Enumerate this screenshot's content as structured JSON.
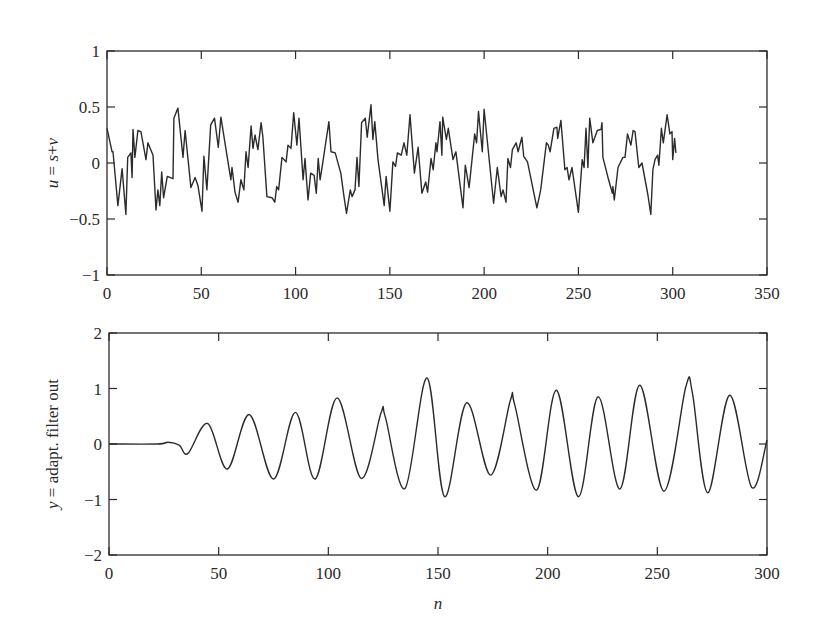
{
  "chart_data": [
    {
      "type": "line",
      "title": "",
      "xlabel": "",
      "ylabel": "u = s+v",
      "ylabel_parts": [
        "u",
        " = ",
        "s",
        "+",
        "v"
      ],
      "xlim": [
        0,
        350
      ],
      "ylim": [
        -1,
        1
      ],
      "xticks": [
        0,
        50,
        100,
        150,
        200,
        250,
        300,
        350
      ],
      "xtick_labels": [
        "0",
        "50",
        "100",
        "150",
        "200",
        "250",
        "300",
        "350"
      ],
      "yticks": [
        1,
        0.5,
        0,
        -0.5,
        -1
      ],
      "ytick_labels": [
        "1",
        "0.5",
        "0",
        "−0.5",
        "−1"
      ],
      "grid": false,
      "legend": null,
      "line_color": "#2b2b2b",
      "series": [
        {
          "name": "u = s+v",
          "x": [
            0,
            2.7,
            3.2,
            5.8,
            8,
            10,
            11,
            12.7,
            13.3,
            13.8,
            14.8,
            16.4,
            18,
            20.7,
            21.7,
            24.4,
            26,
            27,
            28,
            29,
            30,
            32,
            35,
            35.5,
            37.6,
            40.3,
            41.4,
            44.5,
            46.7,
            48.2,
            50.4,
            51.4,
            53,
            55,
            57,
            59,
            60.4,
            63.6,
            65.7,
            66.3,
            67.9,
            69.5,
            71,
            72.6,
            73.7,
            74.8,
            76.4,
            77.4,
            78.5,
            80,
            81.7,
            82.7,
            84.8,
            87.5,
            89,
            90,
            91,
            92.8,
            95,
            96,
            97.6,
            99,
            100.7,
            101.8,
            104,
            105,
            106.6,
            108,
            109.8,
            111,
            112,
            113,
            114.5,
            116,
            117.7,
            118.8,
            121,
            124,
            125.7,
            127,
            129,
            130,
            131.5,
            132.6,
            133.6,
            135,
            137,
            138,
            140,
            141,
            142,
            143.7,
            147,
            148,
            150,
            151.6,
            153,
            154,
            156,
            157.5,
            159,
            160.7,
            163,
            165,
            167,
            169,
            170,
            171.8,
            173,
            174.4,
            175,
            176.6,
            177.6,
            178,
            180,
            181,
            183.5,
            185,
            188.8,
            190,
            192,
            195,
            196,
            197,
            199,
            200,
            205,
            207,
            209,
            210,
            211.6,
            212.6,
            214,
            215,
            217,
            218,
            220,
            221,
            223,
            228,
            230,
            233,
            234,
            235,
            237,
            238.6,
            239,
            240.7,
            242.8,
            244,
            245,
            246.6,
            250,
            252,
            253,
            254,
            255,
            256,
            257.7,
            260,
            262,
            262.5,
            263,
            266,
            268,
            268.3,
            269,
            271,
            273.6,
            274.7,
            276,
            277.8,
            279,
            280,
            282,
            283.7,
            286.9,
            288.4,
            289.5,
            290.6,
            292,
            292.7,
            294,
            295,
            297,
            298.5,
            299.6,
            300,
            301,
            301.7
          ],
          "y": [
            0.31,
            0.1,
            0.1,
            -0.38,
            -0.05,
            -0.46,
            0.05,
            0.09,
            -0.13,
            0.3,
            0.05,
            0.29,
            0.28,
            0.03,
            0.18,
            0.07,
            -0.42,
            -0.24,
            -0.38,
            -0.08,
            -0.31,
            -0.12,
            -0.14,
            0.4,
            0.49,
            0.05,
            0.29,
            -0.22,
            -0.13,
            -0.2,
            -0.43,
            0.06,
            -0.24,
            0.34,
            0.4,
            0.14,
            0.41,
            0.07,
            -0.15,
            -0.04,
            -0.26,
            -0.35,
            -0.15,
            -0.24,
            0.1,
            -0.04,
            0.33,
            0.13,
            0.25,
            0.12,
            0.36,
            0.23,
            -0.3,
            -0.31,
            -0.35,
            -0.21,
            -0.24,
            0.05,
            0.01,
            0.16,
            0.13,
            0.45,
            0.16,
            0.4,
            -0.15,
            0.04,
            -0.33,
            -0.09,
            -0.11,
            -0.27,
            0.04,
            -0.15,
            0.01,
            0.18,
            0.37,
            0.1,
            0.09,
            -0.09,
            -0.3,
            -0.45,
            -0.24,
            -0.3,
            -0.24,
            0.05,
            -0.21,
            0.36,
            0.4,
            0.23,
            0.52,
            0.21,
            0.37,
            0.03,
            -0.38,
            -0.12,
            -0.43,
            0.01,
            -0.03,
            0.09,
            0.07,
            0.18,
            0.07,
            0.43,
            -0.09,
            0.14,
            -0.27,
            -0.17,
            -0.26,
            0.04,
            -0.06,
            0.18,
            0.1,
            0.37,
            0.07,
            0.41,
            0.21,
            0.31,
            0.03,
            0.1,
            -0.4,
            -0.02,
            -0.22,
            0.26,
            0.18,
            0.46,
            0.1,
            0.48,
            -0.36,
            -0.04,
            -0.3,
            -0.24,
            -0.35,
            0.04,
            -0.04,
            0.12,
            0.18,
            0.1,
            0.23,
            0.06,
            0.01,
            -0.4,
            -0.24,
            0.18,
            0.16,
            0.1,
            0.31,
            0.32,
            0.22,
            0.38,
            -0.06,
            -0.04,
            -0.15,
            -0.04,
            -0.44,
            0.03,
            -0.04,
            0.31,
            -0.04,
            0.4,
            0.18,
            0.29,
            0.3,
            0.36,
            0.05,
            -0.15,
            -0.27,
            -0.21,
            -0.33,
            -0.04,
            0.05,
            0.05,
            0.26,
            0.16,
            0.29,
            0.28,
            -0.04,
            0.0,
            -0.29,
            -0.46,
            -0.06,
            0.03,
            0.07,
            -0.02,
            0.31,
            0.18,
            0.43,
            0.26,
            0.28,
            0.03,
            0.22,
            0.09
          ]
        }
      ]
    },
    {
      "type": "line",
      "title": "",
      "xlabel": "n",
      "ylabel": "y = adapt. filter out",
      "ylabel_parts": [
        "y",
        " = adapt. filter out"
      ],
      "xlim": [
        0,
        300
      ],
      "ylim": [
        -2,
        2
      ],
      "xticks": [
        0,
        50,
        100,
        150,
        200,
        250,
        300
      ],
      "xtick_labels": [
        "0",
        "50",
        "100",
        "150",
        "200",
        "250",
        "300"
      ],
      "yticks": [
        2,
        1,
        0,
        -1,
        -2
      ],
      "ytick_labels": [
        "2",
        "1",
        "0",
        "−1",
        "−2"
      ],
      "grid": false,
      "legend": null,
      "line_color": "#2b2b2b",
      "series": [
        {
          "name": "y = adapt. filter out",
          "smooth": true,
          "x": [
            0,
            22,
            27,
            32,
            36,
            45,
            54,
            64,
            75,
            85,
            94,
            104,
            115,
            124,
            126,
            135,
            145,
            153,
            163,
            174,
            183,
            185,
            195,
            204,
            214,
            223,
            233,
            242,
            253,
            263,
            266,
            273,
            283,
            293,
            300
          ],
          "y": [
            0,
            0,
            0.03,
            -0.02,
            -0.17,
            0.37,
            -0.45,
            0.53,
            -0.63,
            0.57,
            -0.63,
            0.83,
            -0.62,
            0.56,
            0.48,
            -0.8,
            1.19,
            -0.95,
            0.74,
            -0.56,
            0.79,
            0.7,
            -0.83,
            0.97,
            -0.95,
            0.85,
            -0.81,
            1.06,
            -0.85,
            1.03,
            0.92,
            -0.88,
            0.88,
            -0.78,
            0.07
          ]
        }
      ]
    }
  ]
}
